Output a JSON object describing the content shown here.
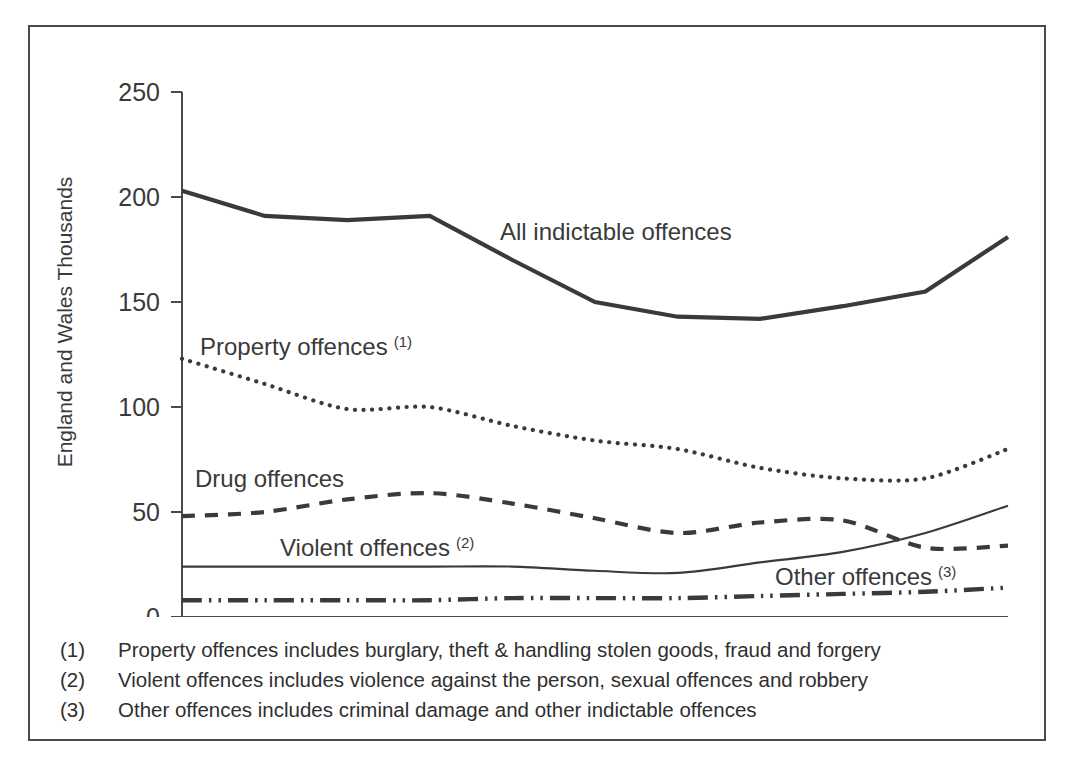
{
  "figure": {
    "y_axis_title": "England and Wales Thousands",
    "y_ticks": [
      "0",
      "50",
      "100",
      "150",
      "200",
      "250"
    ],
    "x_ticks": [
      "1995",
      "1996",
      "1997",
      "1998",
      "1999",
      "2000",
      "2001",
      "2002",
      "2003",
      "2004",
      "2005"
    ],
    "series_labels": {
      "all": "All indictable offences",
      "property": "Property offences",
      "property_sup": "(1)",
      "drug": "Drug offences",
      "violent": "Violent offences",
      "violent_sup": "(2)",
      "other": "Other offences",
      "other_sup": "(3)"
    },
    "footnotes": [
      {
        "marker": "(1)",
        "text": "Property offences includes burglary, theft & handling stolen goods, fraud and forgery"
      },
      {
        "marker": "(2)",
        "text": "Violent offences includes violence against the person, sexual offences and robbery"
      },
      {
        "marker": "(3)",
        "text": "Other offences includes criminal damage and other indictable offences"
      }
    ],
    "colors": {
      "line": "#3a3a3a",
      "frame": "#4a4a4a",
      "background": "#ffffff"
    }
  },
  "chart_data": {
    "type": "line",
    "title": "",
    "xlabel": "",
    "ylabel": "England and Wales Thousands",
    "x": [
      1995,
      1996,
      1997,
      1998,
      1999,
      2000,
      2001,
      2002,
      2003,
      2004,
      2005
    ],
    "xlim": [
      1995,
      2005
    ],
    "ylim": [
      0,
      250
    ],
    "yticks": [
      0,
      50,
      100,
      150,
      200,
      250
    ],
    "grid": false,
    "legend": "inline-annotations",
    "series": [
      {
        "name": "All indictable offences",
        "style": "solid-thick",
        "values": [
          203,
          191,
          189,
          191,
          170,
          150,
          143,
          142,
          148,
          155,
          181
        ]
      },
      {
        "name": "Property offences",
        "style": "dotted",
        "footnote": "(1)",
        "values": [
          123,
          111,
          99,
          100,
          91,
          84,
          80,
          71,
          66,
          66,
          80
        ]
      },
      {
        "name": "Drug offences",
        "style": "dashed",
        "values": [
          48,
          50,
          56,
          59,
          54,
          47,
          40,
          45,
          46,
          33,
          34
        ]
      },
      {
        "name": "Violent offences",
        "style": "solid-thin",
        "footnote": "(2)",
        "values": [
          24,
          24,
          24,
          24,
          24,
          22,
          21,
          26,
          31,
          40,
          53
        ]
      },
      {
        "name": "Other offences",
        "style": "dash-dot-dot",
        "footnote": "(3)",
        "values": [
          8,
          8,
          8,
          8,
          9,
          9,
          9,
          10,
          11,
          12,
          14
        ]
      }
    ]
  }
}
